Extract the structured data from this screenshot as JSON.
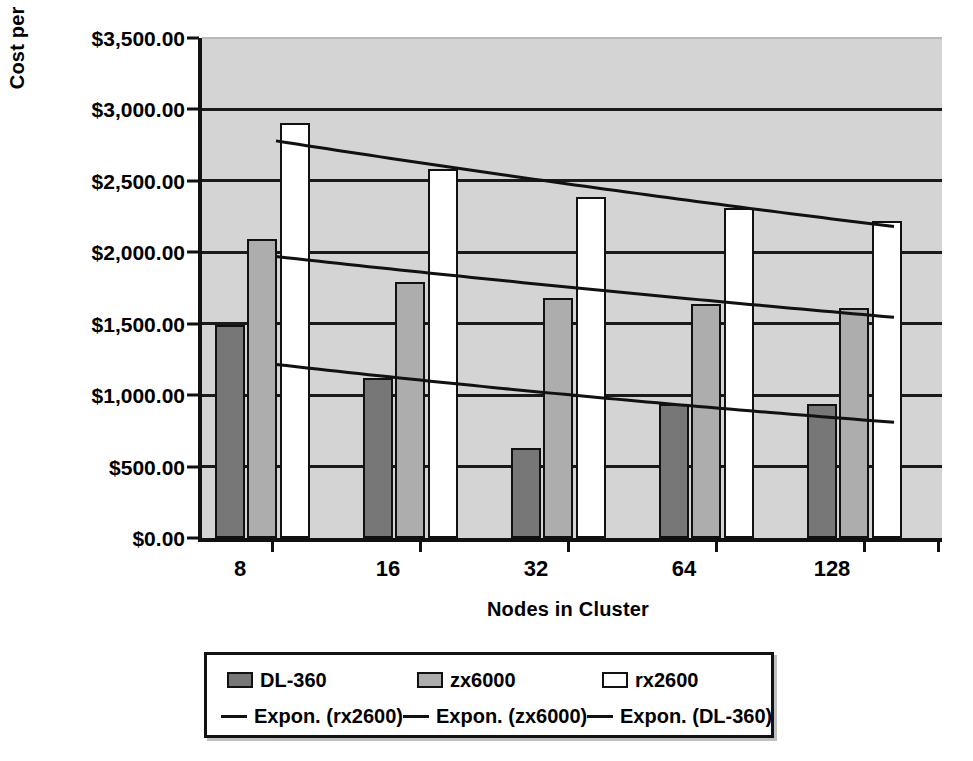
{
  "chart_data": {
    "type": "bar",
    "title": "",
    "xlabel": "Nodes in Cluster",
    "ylabel": "Cost per GFLOP",
    "categories": [
      "8",
      "16",
      "32",
      "64",
      "128"
    ],
    "ylim": [
      0,
      3500
    ],
    "ytick_values": [
      0,
      500,
      1000,
      1500,
      2000,
      2500,
      3000,
      3500
    ],
    "ytick_labels": [
      "$0.00",
      "$500.00",
      "$1,000.00",
      "$1,500.00",
      "$2,000.00",
      "$2,500.00",
      "$3,000.00",
      "$3,500.00"
    ],
    "grid": true,
    "legend_position": "bottom",
    "plot_background": "#d4d4d4",
    "series": [
      {
        "name": "DL-360",
        "color": "#777777",
        "values": [
          1490,
          1120,
          630,
          935,
          940
        ]
      },
      {
        "name": "zx6000",
        "color": "#adadad",
        "values": [
          2095,
          1790,
          1680,
          1640,
          1610
        ]
      },
      {
        "name": "rx2600",
        "color": "#ffffff",
        "values": [
          2905,
          2585,
          2385,
          2310,
          2220
        ]
      }
    ],
    "trendlines": [
      {
        "name": "Expon. (rx2600)",
        "color": "#111111",
        "start_value": 2780,
        "end_value": 2180
      },
      {
        "name": "Expon. (zx6000)",
        "color": "#111111",
        "start_value": 1970,
        "end_value": 1545
      },
      {
        "name": "Expon. (DL-360)",
        "color": "#111111",
        "start_value": 1215,
        "end_value": 810
      }
    ]
  },
  "axes": {
    "y_title": "Cost per GFLOP",
    "x_title": "Nodes in Cluster"
  },
  "legend": {
    "row1": [
      {
        "label": "DL-360",
        "marker": "swatch-dark"
      },
      {
        "label": "zx6000",
        "marker": "swatch-mid"
      },
      {
        "label": "rx2600",
        "marker": "swatch-white"
      }
    ],
    "row2": [
      {
        "label": "Expon. (rx2600)",
        "marker": "line"
      },
      {
        "label": "Expon. (zx6000)",
        "marker": "line"
      },
      {
        "label": "Expon. (DL-360)",
        "marker": "line"
      }
    ]
  }
}
